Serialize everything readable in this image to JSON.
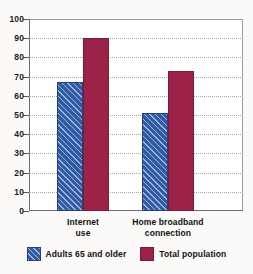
{
  "chart_data": {
    "type": "bar",
    "title": "",
    "xlabel": "",
    "ylabel": "",
    "ylim": [
      0,
      100
    ],
    "yticks": [
      0,
      10,
      20,
      30,
      40,
      50,
      60,
      70,
      80,
      90,
      100
    ],
    "ytick_labels": [
      "0",
      "10",
      "20",
      "30",
      "40",
      "50",
      "60",
      "70",
      "80",
      "90",
      "100"
    ],
    "grid": true,
    "legend_position": "bottom",
    "categories": [
      "Internet use",
      "Home broadband connection"
    ],
    "category_lines": [
      [
        "Internet",
        "use"
      ],
      [
        "Home broadband",
        "connection"
      ]
    ],
    "series": [
      {
        "name": "Adults 65 and older",
        "color": "#2f5ba6",
        "pattern": "diagonal-hatch",
        "values": [
          67,
          51
        ]
      },
      {
        "name": "Total population",
        "color": "#9c2248",
        "pattern": "solid",
        "values": [
          90,
          73
        ]
      }
    ]
  },
  "legend": {
    "items": [
      {
        "label": "Adults 65 and older",
        "swatch": "blue-hatched-swatch"
      },
      {
        "label": "Total population",
        "swatch": "red-solid-swatch"
      }
    ]
  }
}
